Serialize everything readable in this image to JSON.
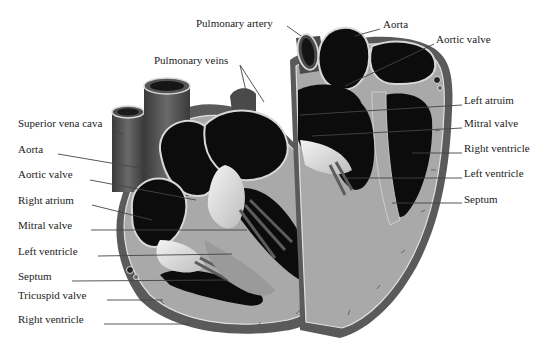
{
  "colors": {
    "background": "#ffffff",
    "chamber": "#0c0c0c",
    "muscle": "#a9a9a9",
    "vessel": "#4d4d4d",
    "outline": "#d8d8d8",
    "label_text": "#222222",
    "leader_line": "#444444"
  },
  "left_heart": {
    "labels": [
      {
        "id": "superior-vena-cava",
        "text": "Superior vena cava",
        "x": 18,
        "y": 123
      },
      {
        "id": "aorta",
        "text": "Aorta",
        "x": 18,
        "y": 149
      },
      {
        "id": "aortic-valve",
        "text": "Aortic valve",
        "x": 18,
        "y": 174
      },
      {
        "id": "right-atrium",
        "text": "Right atrium",
        "x": 18,
        "y": 200
      },
      {
        "id": "mitral-valve",
        "text": "Mitral valve",
        "x": 18,
        "y": 225
      },
      {
        "id": "left-ventricle",
        "text": "Left ventricle",
        "x": 18,
        "y": 251
      },
      {
        "id": "septum",
        "text": "Septum",
        "x": 18,
        "y": 276
      },
      {
        "id": "tricuspid-valve",
        "text": "Tricuspid valve",
        "x": 18,
        "y": 295
      },
      {
        "id": "right-ventricle",
        "text": "Right ventricle",
        "x": 18,
        "y": 319
      },
      {
        "id": "pulmonary-veins",
        "text": "Pulmonary veins",
        "x": 154,
        "y": 60
      },
      {
        "id": "pulmonary-artery",
        "text": "Pulmonary artery",
        "x": 196,
        "y": 23
      }
    ]
  },
  "right_heart": {
    "labels": [
      {
        "id": "aorta-right",
        "text": "Aorta",
        "x": 383,
        "y": 24
      },
      {
        "id": "aortic-valve-right",
        "text": "Aortic valve",
        "x": 436,
        "y": 39
      },
      {
        "id": "left-atrium",
        "text": "Left atruim",
        "x": 464,
        "y": 100
      },
      {
        "id": "mitral-valve-right",
        "text": "Mitral valve",
        "x": 464,
        "y": 123
      },
      {
        "id": "right-ventricle-right",
        "text": "Right ventricle",
        "x": 464,
        "y": 148
      },
      {
        "id": "left-ventricle-right",
        "text": "Left ventricle",
        "x": 464,
        "y": 173
      },
      {
        "id": "septum-right",
        "text": "Septum",
        "x": 464,
        "y": 199
      }
    ]
  }
}
